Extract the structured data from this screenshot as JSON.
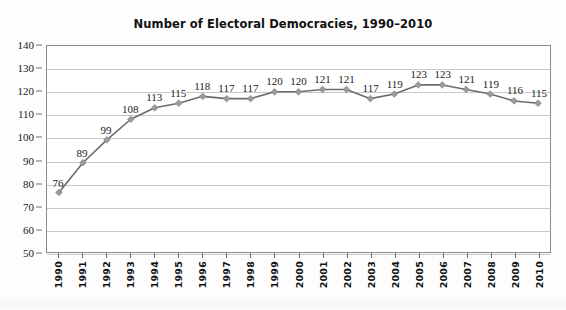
{
  "chart_data": {
    "type": "line",
    "title": "Number of Electoral Democracies, 1990–2010",
    "xlabel": "",
    "ylabel": "",
    "categories": [
      "1990",
      "1991",
      "1992",
      "1993",
      "1994",
      "1995",
      "1996",
      "1997",
      "1998",
      "1999",
      "2000",
      "2001",
      "2002",
      "2003",
      "2004",
      "2005",
      "2006",
      "2007",
      "2008",
      "2009",
      "2010"
    ],
    "values": [
      76,
      89,
      99,
      108,
      113,
      115,
      118,
      117,
      117,
      120,
      120,
      121,
      121,
      117,
      119,
      123,
      123,
      121,
      119,
      116,
      115
    ],
    "data_labels": [
      "76",
      "89",
      "99",
      "108",
      "113",
      "115",
      "118",
      "117",
      "117",
      "120",
      "120",
      "121",
      "121",
      "117",
      "119",
      "123",
      "123",
      "121",
      "119",
      "116",
      "115"
    ],
    "ylim": [
      50,
      140
    ],
    "yticks": [
      50,
      60,
      70,
      80,
      90,
      100,
      110,
      120,
      130,
      140
    ],
    "ytick_labels": [
      "50",
      "60",
      "70",
      "80",
      "90",
      "100",
      "110",
      "120",
      "130",
      "140"
    ],
    "grid": true,
    "grid_axis": "y",
    "legend": false,
    "legend_position": "none",
    "series": [
      {
        "name": "Electoral democracies",
        "values": [
          76,
          89,
          99,
          108,
          113,
          115,
          118,
          117,
          117,
          120,
          120,
          121,
          121,
          117,
          119,
          123,
          123,
          121,
          119,
          116,
          115
        ],
        "line_color": "#6b6b6b",
        "marker": "diamond",
        "marker_color": "#9a9a9a"
      }
    ],
    "colors": {
      "line": "#6b6b6b",
      "marker": "#9a9a9a",
      "gridline": "#c9c9c9",
      "axis": "#8a8a8a",
      "text": "#1a1a1a",
      "background": "#ffffff"
    }
  }
}
